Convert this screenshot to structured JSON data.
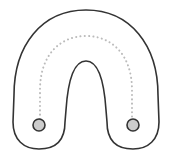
{
  "diagram": {
    "type": "horseshoe-path",
    "colors": {
      "background": "#ffffff",
      "outline": "#333333",
      "dotted_path": "#bbbbbb",
      "node_fill": "#cccccc",
      "node_stroke": "#333333"
    },
    "nodes": [
      {
        "id": "left-endpoint",
        "cx": 39,
        "cy": 125,
        "r": 6
      },
      {
        "id": "right-endpoint",
        "cx": 133,
        "cy": 125,
        "r": 6
      }
    ]
  }
}
